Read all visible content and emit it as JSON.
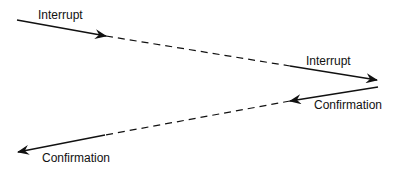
{
  "diagram": {
    "labels": {
      "interrupt_start": "Interrupt",
      "interrupt_end": "Interrupt",
      "confirmation_start": "Confirmation",
      "confirmation_end": "Confirmation"
    },
    "colors": {
      "line": "#111111",
      "background": "#ffffff"
    }
  }
}
